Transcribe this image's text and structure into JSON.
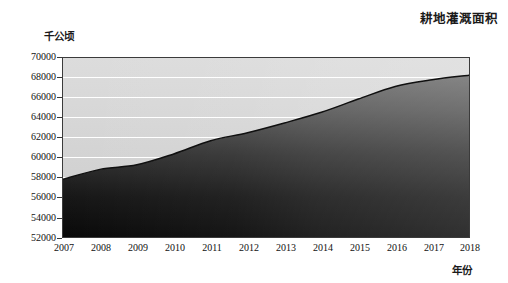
{
  "chart_data": {
    "type": "area",
    "title": "耕地灌溉面积",
    "xlabel": "年份",
    "ylabel": "千公顷",
    "categories": [
      2007,
      2008,
      2009,
      2010,
      2011,
      2012,
      2013,
      2014,
      2015,
      2016,
      2017,
      2018
    ],
    "x_tick_labels": [
      "2007",
      "2008",
      "2009",
      "2010",
      "2011",
      "2012",
      "2013",
      "2014",
      "2015",
      "2016",
      "2017",
      "2018"
    ],
    "values": [
      57800,
      58800,
      59260,
      60350,
      61680,
      62490,
      63470,
      64540,
      65870,
      67140,
      67816,
      68272
    ],
    "y_tick_labels": [
      "70000",
      "68000",
      "66000",
      "64000",
      "62000",
      "60000",
      "58000",
      "56000",
      "54000",
      "52000"
    ],
    "y_ticks": [
      70000,
      68000,
      66000,
      64000,
      62000,
      60000,
      58000,
      56000,
      54000,
      52000
    ],
    "ylim": [
      52000,
      70000
    ],
    "xlim": [
      2007,
      2018
    ],
    "grid": true,
    "grid_axis": "y",
    "legend": false,
    "series": [
      {
        "name": "耕地灌溉面积",
        "values": [
          57800,
          58800,
          59260,
          60350,
          61680,
          62490,
          63470,
          64540,
          65870,
          67140,
          67816,
          68272
        ]
      }
    ],
    "colors": {
      "plot_background": "#d2d2d2",
      "area_fill_top": "#6b6b6b",
      "area_fill_bottom": "#0d0d0d",
      "line": "#141414",
      "gridline": "#ffffff",
      "axis": "#3b3b3b",
      "text": "#111111"
    }
  }
}
